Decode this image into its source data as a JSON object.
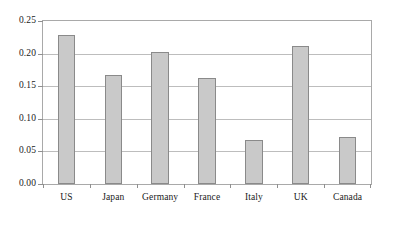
{
  "chart_data": {
    "type": "bar",
    "title": "",
    "subtitle": "",
    "xlabel": "",
    "ylabel": "",
    "categories": [
      "US",
      "Japan",
      "Germany",
      "France",
      "Italy",
      "UK",
      "Canada"
    ],
    "values": [
      0.228,
      0.167,
      0.202,
      0.162,
      0.068,
      0.212,
      0.072
    ],
    "ylim": [
      0.0,
      0.25
    ],
    "ytick_values": [
      0.0,
      0.05,
      0.1,
      0.15,
      0.2,
      0.25
    ],
    "ytick_labels": [
      "0.00",
      "0.05",
      "0.10",
      "0.15",
      "0.20",
      "0.25"
    ],
    "grid": true,
    "grid_axis": "y",
    "legend": false,
    "legend_position": "none",
    "bar_fill_color": "#c9c9c9",
    "bar_edge_color": "#8a8a8a",
    "grid_color": "#bdbdbd",
    "frame_color": "#a9a9a9",
    "text_color": "#1a1a1a",
    "background_color": "#ffffff",
    "series": [
      {
        "name": "",
        "values": [
          0.228,
          0.167,
          0.202,
          0.162,
          0.068,
          0.212,
          0.072
        ]
      }
    ]
  }
}
